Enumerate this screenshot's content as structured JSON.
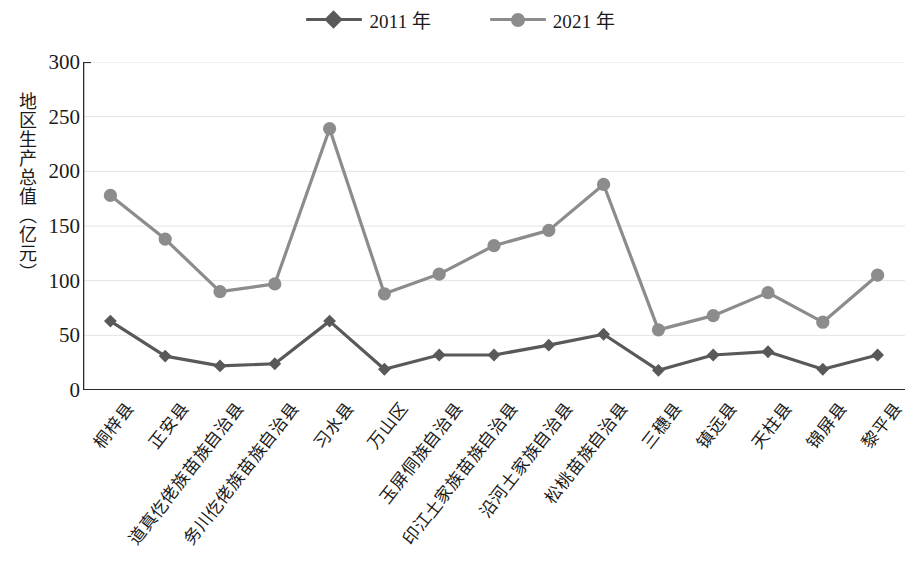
{
  "legend": {
    "items": [
      {
        "label": "2011 年",
        "color": "#595959",
        "marker": "diamond"
      },
      {
        "label": "2021 年",
        "color": "#8c8c8c",
        "marker": "circle"
      }
    ]
  },
  "axis": {
    "y_title": "地区生产总值（亿元）",
    "y_ticks": [
      "0",
      "50",
      "100",
      "150",
      "200",
      "250",
      "300"
    ]
  },
  "chart_data": {
    "type": "line",
    "title": "",
    "xlabel": "",
    "ylabel": "地区生产总值（亿元）",
    "ylim": [
      0,
      300
    ],
    "ytick_values": [
      0,
      50,
      100,
      150,
      200,
      250,
      300
    ],
    "grid": true,
    "legend_position": "top-center",
    "categories": [
      "桐梓县",
      "正安县",
      "道真仡佬族苗族自治县",
      "务川仡佬族苗族自治县",
      "习水县",
      "万山区",
      "玉屏侗族自治县",
      "印江土家族苗族自治县",
      "沿河土家族自治县",
      "松桃苗族自治县",
      "三穗县",
      "镇远县",
      "天柱县",
      "锦屏县",
      "黎平县"
    ],
    "series": [
      {
        "name": "2011 年",
        "color": "#595959",
        "marker": "diamond",
        "values": [
          63,
          31,
          22,
          24,
          63,
          19,
          32,
          32,
          41,
          51,
          18,
          32,
          35,
          19,
          32
        ]
      },
      {
        "name": "2021 年",
        "color": "#8c8c8c",
        "marker": "circle",
        "values": [
          178,
          138,
          90,
          97,
          239,
          88,
          106,
          132,
          146,
          188,
          55,
          68,
          89,
          62,
          105
        ]
      }
    ]
  }
}
